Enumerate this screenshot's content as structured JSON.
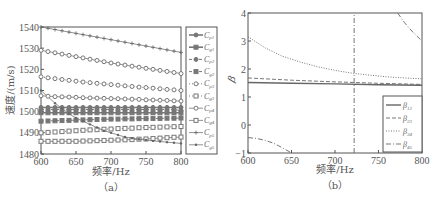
{
  "chart_data": [
    {
      "type": "line",
      "panel_label": "（a）",
      "title": "",
      "xlabel": "频率/Hz",
      "ylabel": "速度/(m/s)",
      "xlim": [
        600,
        800
      ],
      "ylim": [
        1480,
        1540
      ],
      "xticks": [
        600,
        650,
        700,
        750,
        800
      ],
      "yticks": [
        1480,
        1490,
        1500,
        1510,
        1520,
        1530,
        1540
      ],
      "grid": false,
      "legend_position": "right-outside",
      "x": [
        600,
        610,
        620,
        630,
        640,
        650,
        660,
        670,
        680,
        690,
        700,
        710,
        720,
        730,
        740,
        750,
        760,
        770,
        780,
        790,
        800
      ],
      "series": [
        {
          "name": "C_p1",
          "label_main": "C",
          "label_sub": "p1",
          "marker": "filled-circle",
          "line": "solid",
          "values": [
            1502,
            1502,
            1502,
            1502,
            1502,
            1502,
            1502,
            1502,
            1502,
            1502,
            1502,
            1502,
            1502,
            1502,
            1502,
            1502,
            1502,
            1502,
            1502,
            1502,
            1502
          ]
        },
        {
          "name": "C_g1",
          "label_main": "C",
          "label_sub": "g1",
          "marker": "filled-square",
          "line": "solid",
          "values": [
            1499.5,
            1499.5,
            1499.5,
            1499.5,
            1499.5,
            1499.5,
            1499.5,
            1499.5,
            1499.5,
            1499.5,
            1499.5,
            1499.5,
            1499.5,
            1499.5,
            1499.5,
            1499.5,
            1499.5,
            1499.5,
            1499.5,
            1499.5,
            1499.5
          ]
        },
        {
          "name": "C_p2",
          "label_main": "C",
          "label_sub": "p2",
          "marker": "filled-circle",
          "line": "dashed",
          "values": [
            1501,
            1501,
            1501,
            1501,
            1501,
            1501,
            1501,
            1501,
            1501,
            1501,
            1501,
            1501,
            1501,
            1501,
            1501,
            1501,
            1501,
            1501,
            1501,
            1501,
            1500.5
          ]
        },
        {
          "name": "C_g2",
          "label_main": "C",
          "label_sub": "g2",
          "marker": "filled-square",
          "line": "dashed",
          "values": [
            1495.5,
            1495.6,
            1495.7,
            1495.8,
            1495.9,
            1496,
            1496.1,
            1496.2,
            1496.3,
            1496.4,
            1496.5,
            1496.5,
            1496.6,
            1496.6,
            1496.7,
            1496.7,
            1496.8,
            1496.8,
            1496.9,
            1496.9,
            1497
          ]
        },
        {
          "name": "C_p3",
          "label_main": "C",
          "label_sub": "p3",
          "marker": "open-circle",
          "line": "dotted",
          "values": [
            1516.5,
            1516,
            1515.6,
            1515.2,
            1514.8,
            1514.4,
            1514,
            1513.7,
            1513.4,
            1513.1,
            1512.8,
            1512.5,
            1512.2,
            1511.9,
            1511.6,
            1511.4,
            1511.1,
            1510.8,
            1510.5,
            1510.3,
            1510
          ]
        },
        {
          "name": "C_g3",
          "label_main": "C",
          "label_sub": "g3",
          "marker": "open-square",
          "line": "dotted",
          "values": [
            1490,
            1490.2,
            1490.4,
            1490.6,
            1490.8,
            1491,
            1491.2,
            1491.4,
            1491.5,
            1491.7,
            1491.8,
            1492,
            1492.1,
            1492.2,
            1492.4,
            1492.5,
            1492.6,
            1492.7,
            1492.8,
            1492.9,
            1493
          ]
        },
        {
          "name": "C_p4",
          "label_main": "C",
          "label_sub": "p4",
          "marker": "open-circle",
          "line": "solid-thin",
          "values": [
            1529,
            1528.4,
            1527.8,
            1527.2,
            1526.6,
            1526,
            1525.4,
            1524.8,
            1524.2,
            1523.6,
            1523,
            1522.5,
            1522,
            1521.5,
            1521,
            1520.5,
            1520,
            1519.5,
            1519,
            1518.5,
            1518
          ]
        },
        {
          "name": "C_g4",
          "label_main": "C",
          "label_sub": "g4",
          "marker": "open-square",
          "line": "solid-thin",
          "values": [
            1486,
            1486,
            1486,
            1486,
            1486,
            1486,
            1486.1,
            1486.2,
            1486.3,
            1486.4,
            1486.5,
            1486.6,
            1486.7,
            1486.8,
            1487,
            1487.1,
            1487.3,
            1487.5,
            1487.7,
            1487.9,
            1488
          ]
        },
        {
          "name": "C_p5",
          "label_main": "C",
          "label_sub": "p5",
          "marker": "plus",
          "line": "solid-thin",
          "values": [
            1540,
            1539.4,
            1538.8,
            1538.2,
            1537.6,
            1537,
            1536.4,
            1535.8,
            1535.2,
            1534.6,
            1534,
            1533.4,
            1532.8,
            1532.2,
            1531.6,
            1531,
            1530.4,
            1529.8,
            1529.2,
            1528.6,
            1528
          ]
        },
        {
          "name": "C_g5",
          "label_main": "C",
          "label_sub": "g5",
          "marker": "dot",
          "line": "solid-thin",
          "values": [
            1510,
            1507,
            1504,
            1501.5,
            1499,
            1497,
            1495.5,
            1494,
            1492.5,
            1491,
            1490,
            1489,
            1488,
            1487.5,
            1487,
            1486.6,
            1486.2,
            1485.9,
            1485.6,
            1485.3,
            1485
          ]
        }
      ],
      "extra_series_note": "A second open-circle row (approx. 1507.5 → 1505) is also drawn",
      "extra_series": {
        "name": "C_p4-branch",
        "values": [
          1507.5,
          1507.3,
          1507.1,
          1507,
          1506.9,
          1506.8,
          1506.6,
          1506.5,
          1506.4,
          1506.3,
          1506.2,
          1506.1,
          1506,
          1505.9,
          1505.8,
          1505.6,
          1505.5,
          1505.4,
          1505.3,
          1505.1,
          1505
        ]
      }
    },
    {
      "type": "line",
      "panel_label": "（b）",
      "title": "",
      "xlabel": "频率/Hz",
      "ylabel": "β",
      "xlim": [
        600,
        800
      ],
      "ylim": [
        -1,
        4
      ],
      "xticks": [
        600,
        650,
        700,
        750,
        800
      ],
      "yticks": [
        -1,
        0,
        1,
        2,
        3,
        4
      ],
      "grid": false,
      "legend_position": "bottom-right",
      "series": [
        {
          "name": "β12",
          "label_main": "β",
          "label_sub": "12",
          "line": "solid",
          "x": [
            600,
            650,
            700,
            750,
            800
          ],
          "values": [
            1.52,
            1.49,
            1.47,
            1.44,
            1.42
          ]
        },
        {
          "name": "β23",
          "label_main": "β",
          "label_sub": "23",
          "line": "dashed",
          "x": [
            600,
            650,
            700,
            750,
            800
          ],
          "values": [
            1.68,
            1.6,
            1.54,
            1.49,
            1.45
          ]
        },
        {
          "name": "β34",
          "label_main": "β",
          "label_sub": "34",
          "line": "dotted",
          "x": [
            600,
            620,
            640,
            660,
            680,
            700,
            720,
            740,
            760,
            780,
            800
          ],
          "values": [
            3.15,
            2.75,
            2.45,
            2.25,
            2.08,
            1.95,
            1.85,
            1.78,
            1.72,
            1.68,
            1.65
          ]
        },
        {
          "name": "β45",
          "label_main": "β",
          "label_sub": "45",
          "line": "dash-dot",
          "segments": [
            {
              "x": [
                600,
                610,
                620,
                630,
                640,
                650
              ],
              "values": [
                -0.45,
                -0.48,
                -0.55,
                -0.66,
                -0.82,
                -1.0
              ]
            },
            {
              "x": [
                722,
                722
              ],
              "values": [
                -1,
                4
              ]
            },
            {
              "x": [
                772,
                780,
                790,
                800
              ],
              "values": [
                4.0,
                3.65,
                3.3,
                3.0
              ]
            }
          ]
        }
      ]
    }
  ]
}
